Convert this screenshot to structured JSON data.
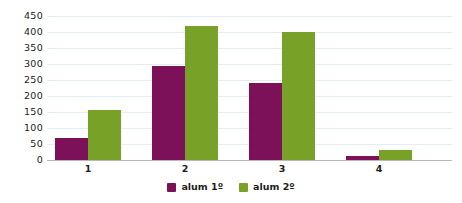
{
  "chart_data": {
    "type": "bar",
    "title": "",
    "subtitle": "",
    "xlabel": "",
    "ylabel": "",
    "categories": [
      "1",
      "2",
      "3",
      "4"
    ],
    "series": [
      {
        "name": "alum 1º",
        "color": "#7d1159",
        "values": [
          70,
          293,
          240,
          12
        ]
      },
      {
        "name": "alum 2º",
        "color": "#78a127",
        "values": [
          155,
          420,
          400,
          30
        ]
      }
    ],
    "ylim": [
      0,
      450
    ],
    "yticks": [
      0,
      50,
      100,
      150,
      200,
      250,
      300,
      350,
      400,
      450
    ],
    "ytick_labels": [
      "0",
      "50",
      "100",
      "150",
      "200",
      "250",
      "300",
      "350",
      "400",
      "450"
    ],
    "grid": true,
    "grid_color": "#e4eef2",
    "axis_color": "#b9b9b9",
    "legend_position": "bottom",
    "background": "#ffffff"
  }
}
